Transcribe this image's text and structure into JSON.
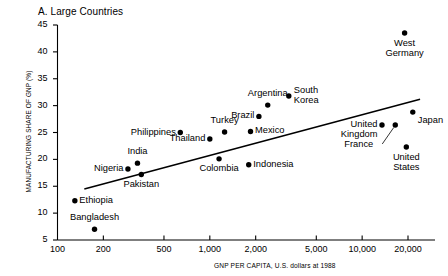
{
  "panel": {
    "title": "A. Large Countries"
  },
  "axes": {
    "ylabel": "MANUFACTURING SHARE OF GNP (%)",
    "xlabel": "GNP PER CAPITA, U.S. dollars at 1988",
    "yticks": [
      "5",
      "10",
      "15",
      "20",
      "25",
      "30",
      "35",
      "40",
      "45"
    ],
    "xticks": [
      "100",
      "200",
      "500",
      "1,000",
      "2,000",
      "5,000",
      "10,000",
      "20,000"
    ]
  },
  "colors": {
    "ink": "#000000",
    "paper": "#ffffff"
  },
  "chart_data": {
    "type": "scatter",
    "title": "A. Large Countries",
    "xlabel": "GNP PER CAPITA, U.S. dollars at 1988",
    "ylabel": "MANUFACTURING SHARE OF GNP (%)",
    "xscale": "log",
    "xlim": [
      100,
      25000
    ],
    "ylim": [
      5,
      45
    ],
    "yticks": [
      5,
      10,
      15,
      20,
      25,
      30,
      35,
      40,
      45
    ],
    "xticks": [
      100,
      200,
      500,
      1000,
      2000,
      5000,
      10000,
      20000
    ],
    "grid": false,
    "legend": "none",
    "points": [
      {
        "label": "Ethiopia",
        "x": 130,
        "y": 12.3,
        "label_pos": "right"
      },
      {
        "label": "Bangladesh",
        "x": 175,
        "y": 7.0,
        "label_pos": "above"
      },
      {
        "label": "Nigeria",
        "x": 290,
        "y": 18.2,
        "label_pos": "left"
      },
      {
        "label": "India",
        "x": 335,
        "y": 19.3,
        "label_pos": "above"
      },
      {
        "label": "Pakistan",
        "x": 355,
        "y": 17.2,
        "label_pos": "below"
      },
      {
        "label": "Philippines",
        "x": 640,
        "y": 25.0,
        "label_pos": "left"
      },
      {
        "label": "Thailand",
        "x": 1000,
        "y": 23.8,
        "label_pos": "left"
      },
      {
        "label": "Turkey",
        "x": 1250,
        "y": 25.1,
        "label_pos": "above"
      },
      {
        "label": "Colombia",
        "x": 1150,
        "y": 20.1,
        "label_pos": "below"
      },
      {
        "label": "Indonesia",
        "x": 1800,
        "y": 19.0,
        "label_pos": "right"
      },
      {
        "label": "Brazil",
        "x": 2100,
        "y": 28.0,
        "label_pos": "left"
      },
      {
        "label": "Mexico",
        "x": 1850,
        "y": 25.2,
        "label_pos": "right"
      },
      {
        "label": "Argentina",
        "x": 2400,
        "y": 30.1,
        "label_pos": "above"
      },
      {
        "label": "South Korea",
        "x": 3300,
        "y": 31.8,
        "label_pos": "right"
      },
      {
        "label": "West Germany",
        "x": 19000,
        "y": 43.5,
        "label_pos": "below"
      },
      {
        "label": "United Kingdom",
        "x": 13500,
        "y": 26.4,
        "label_pos": "left"
      },
      {
        "label": "France",
        "x": 16500,
        "y": 26.4,
        "label_pos": "leader"
      },
      {
        "label": "Japan",
        "x": 21500,
        "y": 28.8,
        "label_pos": "left-below"
      },
      {
        "label": "United States",
        "x": 19500,
        "y": 22.3,
        "label_pos": "below"
      }
    ],
    "trendline": {
      "x0": 150,
      "y0": 14.5,
      "x1": 24000,
      "y1": 31.2
    }
  }
}
